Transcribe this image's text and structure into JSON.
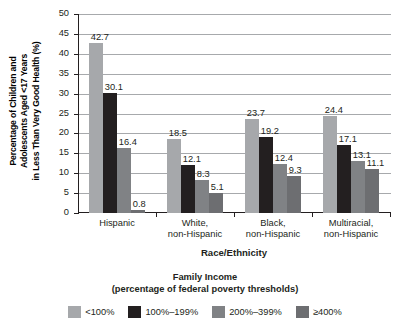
{
  "chart_data": {
    "type": "bar",
    "title": "",
    "categories": [
      "Hispanic",
      "White,\nnon-Hispanic",
      "Black,\nnon-Hispanic",
      "Multiracial,\nnon-Hispanic"
    ],
    "category_lines": [
      [
        "Hispanic"
      ],
      [
        "White,",
        "non-Hispanic"
      ],
      [
        "Black,",
        "non-Hispanic"
      ],
      [
        "Multiracial,",
        "non-Hispanic"
      ]
    ],
    "series": [
      {
        "name": "<100%",
        "color": "#a6a8ab",
        "values": [
          42.7,
          18.5,
          23.7,
          24.4
        ]
      },
      {
        "name": "100%–199%",
        "color": "#231f20",
        "values": [
          30.1,
          12.1,
          19.2,
          17.1
        ]
      },
      {
        "name": "200%–399%",
        "color": "#808285",
        "values": [
          16.4,
          8.3,
          12.4,
          13.1
        ]
      },
      {
        "name": "≥400%",
        "color": "#6d6e71",
        "values": [
          0.8,
          5.1,
          9.3,
          11.1
        ]
      }
    ],
    "xlabel": "Race/Ethnicity",
    "ylabel": "Percentage of Children and Adolescents Aged <17 Years in Less Than Very Good Health (%)",
    "ylabel_lines": [
      "Percentage of Children and",
      "Adolescents Aged <17 Years",
      "in Less Than Very Good Health (%)"
    ],
    "ylim": [
      0,
      50
    ],
    "ytick_values": [
      0,
      5,
      10,
      15,
      20,
      25,
      30,
      35,
      40,
      45,
      50
    ],
    "ytick_labels": [
      "0",
      "5",
      "10",
      "15",
      "20",
      "25",
      "30",
      "35",
      "40",
      "45",
      "50"
    ],
    "grid": true,
    "legend_position": "bottom",
    "legend_title_lines": [
      "Family Income",
      "(percentage of federal poverty thresholds)"
    ],
    "data_labels": [
      [
        "42.7",
        "30.1",
        "16.4",
        "0.8"
      ],
      [
        "18.5",
        "12.1",
        "8.3",
        "5.1"
      ],
      [
        "23.7",
        "19.2",
        "12.4",
        "9.3"
      ],
      [
        "24.4",
        "17.1",
        "13.1",
        "11.1"
      ]
    ]
  },
  "colors": {
    "axis": "#231f20",
    "grid": "#a7a9ab",
    "background": "#ffffff"
  }
}
